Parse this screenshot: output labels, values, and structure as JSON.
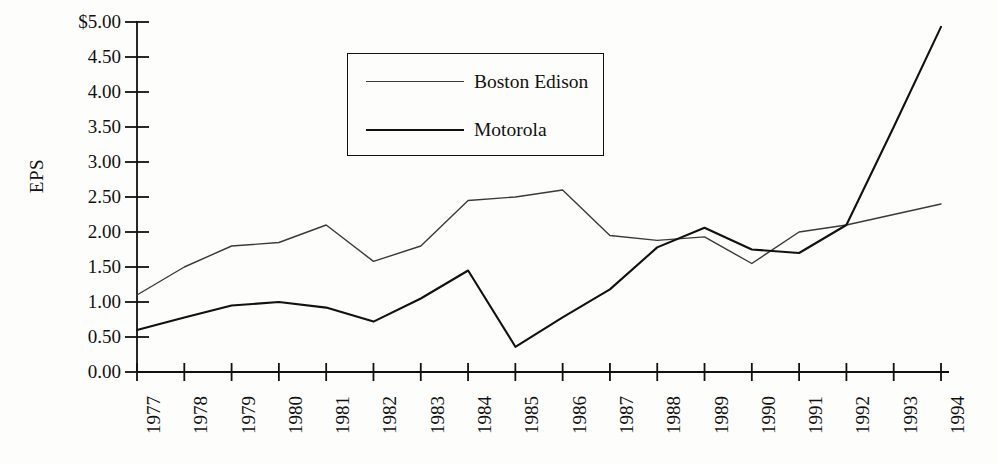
{
  "chart_data": {
    "type": "line",
    "title": "",
    "xlabel": "",
    "ylabel": "EPS",
    "x": [
      "1977",
      "1978",
      "1979",
      "1980",
      "1981",
      "1982",
      "1983",
      "1984",
      "1985",
      "1986",
      "1987",
      "1988",
      "1989",
      "1990",
      "1991",
      "1992",
      "1993",
      "1994"
    ],
    "categories": [
      "1977",
      "1978",
      "1979",
      "1980",
      "1981",
      "1982",
      "1983",
      "1984",
      "1985",
      "1986",
      "1987",
      "1988",
      "1989",
      "1990",
      "1991",
      "1992",
      "1993",
      "1994"
    ],
    "series": [
      {
        "name": "Boston Edison",
        "style": "thin",
        "color": "#3a3a3a",
        "values": [
          1.1,
          1.5,
          1.8,
          1.85,
          2.1,
          1.58,
          1.8,
          2.45,
          2.5,
          2.6,
          1.95,
          1.88,
          1.93,
          1.55,
          2.0,
          2.1,
          2.25,
          2.4
        ]
      },
      {
        "name": "Motorola",
        "style": "thick",
        "color": "#111111",
        "values": [
          0.6,
          0.78,
          0.95,
          1.0,
          0.92,
          0.72,
          1.05,
          1.45,
          0.36,
          0.78,
          1.18,
          1.78,
          2.06,
          1.75,
          1.7,
          2.1,
          3.5,
          4.93
        ]
      }
    ],
    "ylim": [
      0.0,
      5.0
    ],
    "ytick_values": [
      5.0,
      4.5,
      4.0,
      3.5,
      3.0,
      2.5,
      2.0,
      1.5,
      1.0,
      0.5,
      0.0
    ],
    "ytick_labels": [
      "$5.00",
      "4.50",
      "4.00",
      "3.50",
      "3.00",
      "2.50",
      "2.00",
      "1.50",
      "1.00",
      "0.50",
      "0.00"
    ],
    "grid": false,
    "legend_position": "upper-center",
    "legend_entries": [
      "Boston Edison",
      "Motorola"
    ]
  },
  "legend": {
    "entries": [
      {
        "label": "Boston Edison"
      },
      {
        "label": "Motorola"
      }
    ]
  },
  "axis": {
    "y_title": "EPS"
  }
}
